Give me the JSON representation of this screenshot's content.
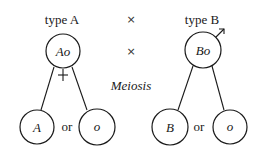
{
  "diagram": {
    "parents": [
      {
        "type_label": "type A",
        "genotype": "Ao",
        "sex_symbol": "female-symbol"
      },
      {
        "type_label": "type B",
        "genotype": "Bo",
        "sex_symbol": "male-symbol"
      }
    ],
    "cross_symbols": [
      "×",
      "×"
    ],
    "process_label": "Meiosis",
    "gametes": {
      "left": [
        {
          "allele": "A"
        },
        {
          "allele": "o"
        }
      ],
      "right": [
        {
          "allele": "B"
        },
        {
          "allele": "o"
        }
      ],
      "separator": "or"
    }
  }
}
